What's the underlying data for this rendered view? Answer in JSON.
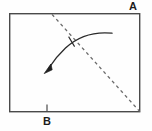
{
  "figure": {
    "labels": {
      "corner_a": "A",
      "edge_b": "B"
    },
    "colors": {
      "stroke": "#4a4a4a",
      "dashed_stroke": "#6b6b6b",
      "arrow_stroke": "#2b2b2b",
      "label_text": "#1c1c1c",
      "background": "#fefefe"
    },
    "geometry": {
      "rectangle": {
        "x": 9,
        "y": 13,
        "width": 131,
        "height": 99,
        "stroke_width": 1.4
      },
      "dashed_line": {
        "x1": 52,
        "y1": 14,
        "x2": 140,
        "y2": 112,
        "dash_pattern": "3 3",
        "stroke_width": 1.3
      },
      "tick_b": {
        "x": 47,
        "y_top": 105,
        "y_bottom": 112
      },
      "curved_arrow": {
        "start_x": 112,
        "start_y": 33,
        "control_x": 74,
        "control_y": 38,
        "end_x": 46,
        "end_y": 71,
        "stroke_width": 1.3,
        "arrowhead": "solid-triangle"
      },
      "crossing_tick": {
        "x1": 69,
        "y1": 37,
        "x2": 75,
        "y2": 47
      }
    }
  }
}
